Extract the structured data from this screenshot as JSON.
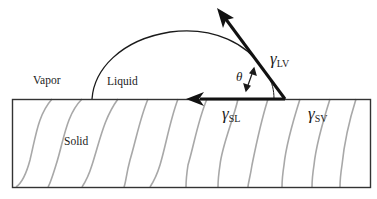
{
  "diagram": {
    "phases": {
      "vapor": "Vapor",
      "liquid": "Liquid",
      "solid": "Solid"
    },
    "angle_symbol": "θ",
    "tensions": {
      "lv": {
        "symbol": "γ",
        "subscript": "LV"
      },
      "sl": {
        "symbol": "γ",
        "subscript": "SL"
      },
      "sv": {
        "symbol": "γ",
        "subscript": "SV"
      }
    },
    "colors": {
      "outline": "#333333",
      "arrow": "#111111",
      "grain_lines": "#a8a8a8",
      "background": "#ffffff"
    }
  }
}
